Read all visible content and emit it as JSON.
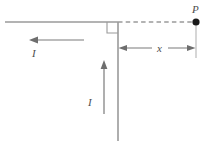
{
  "figure": {
    "type": "physics-diagram",
    "colors": {
      "wire": "#9a9a9a",
      "dashed": "#9a9a9a",
      "arrow": "#6e6e6e",
      "point": "#1a1a1a",
      "label": "#4d4d4d",
      "background": "#ffffff"
    },
    "labels": {
      "current_horizontal": "I",
      "current_vertical": "I",
      "distance": "x",
      "point": "P"
    },
    "elements": {
      "horizontal_wire": "horizontal-wire-segment",
      "vertical_wire": "vertical-wire-segment",
      "right_angle_marker": "right-angle-square",
      "dashed_line": "dashed-projection-line",
      "dimension_arrow": "double-headed-dimension-arrow",
      "extension_line": "vertical-extension-line",
      "current_arrow_horizontal": "left-pointing-current-arrow",
      "current_arrow_vertical": "up-pointing-current-arrow",
      "field_point": "filled-dot-point-P"
    },
    "geometry": {
      "corner_x": 118,
      "corner_y": 22,
      "point_x": 196,
      "point_y": 22,
      "wire_left_x": 5,
      "wire_bottom_y": 140,
      "dimension_y": 48
    }
  }
}
